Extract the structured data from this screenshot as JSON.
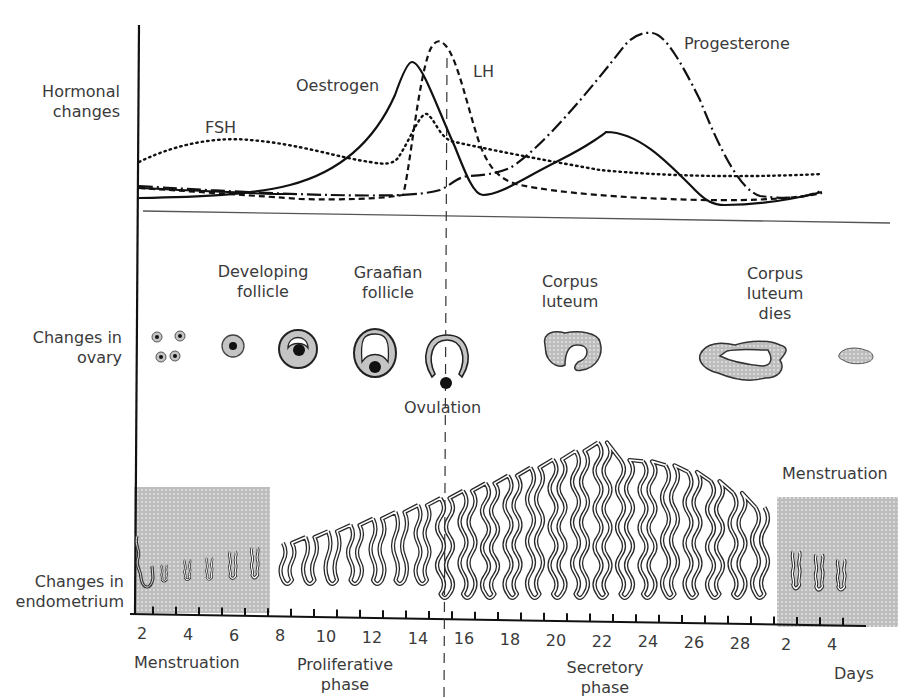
{
  "rows": {
    "hormones": "Hormonal changes",
    "ovary": "Changes in ovary",
    "endometrium": "Changes in endometrium"
  },
  "hormone_labels": {
    "fsh": "FSH",
    "oestrogen": "Oestrogen",
    "lh": "LH",
    "progesterone": "Progesterone"
  },
  "ovary_labels": {
    "developing": "Developing follicle",
    "graafian": "Graafian follicle",
    "ovulation": "Ovulation",
    "corpus_luteum": "Corpus luteum",
    "corpus_luteum_dies": "Corpus luteum dies"
  },
  "phase_labels": {
    "menstruation_start": "Menstruation",
    "proliferative": "Proliferative phase",
    "secretory": "Secretory phase",
    "menstruation_end": "Menstruation",
    "days": "Days"
  },
  "axis": {
    "day_ticks": [
      "2",
      "4",
      "6",
      "8",
      "10",
      "12",
      "14",
      "16",
      "18",
      "20",
      "22",
      "24",
      "26",
      "28",
      "2",
      "4"
    ],
    "ovulation_day": 14
  },
  "colors": {
    "line": "#1a1a1a",
    "menses_fill": "#bdbdbd",
    "follicle_fill": "#c8c8c8",
    "text": "#3a3a3a"
  },
  "chart_data": {
    "type": "line",
    "title": "",
    "xlabel": "Days",
    "ylabel": "Hormonal changes",
    "x": [
      1,
      2,
      3,
      4,
      5,
      6,
      7,
      8,
      9,
      10,
      11,
      12,
      13,
      14,
      15,
      16,
      17,
      18,
      19,
      20,
      21,
      22,
      23,
      24,
      25,
      26,
      27,
      28
    ],
    "series": [
      {
        "name": "FSH",
        "style": "dotted",
        "values": [
          3,
          3.6,
          3.9,
          4,
          3.9,
          3.7,
          3.3,
          3,
          2.6,
          2.4,
          2.3,
          2.3,
          5,
          3.2,
          2.6,
          2.3,
          2.1,
          1.9,
          1.8,
          1.7,
          1.6,
          1.5,
          1.5,
          1.4,
          1.4,
          1.3,
          1.3,
          1.4
        ]
      },
      {
        "name": "Oestrogen",
        "style": "solid",
        "values": [
          0.5,
          0.5,
          0.6,
          0.7,
          0.9,
          1.2,
          1.6,
          2.2,
          3,
          4,
          5.4,
          7,
          8.2,
          5.5,
          1,
          1.3,
          2.2,
          3.4,
          4.3,
          4.8,
          4.6,
          3.9,
          2.6,
          1,
          0.4,
          0.4,
          0.5,
          0.7
        ]
      },
      {
        "name": "LH",
        "style": "dashed",
        "values": [
          0.9,
          0.8,
          0.7,
          0.6,
          0.5,
          0.5,
          0.4,
          0.4,
          0.3,
          0.3,
          0.3,
          0.4,
          9,
          9.6,
          5,
          1.5,
          1,
          0.8,
          0.6,
          0.5,
          0.4,
          0.4,
          0.4,
          0.4,
          0.4,
          0.4,
          0.5,
          0.6
        ]
      },
      {
        "name": "Progesterone",
        "style": "dash-dot",
        "values": [
          0.8,
          0.7,
          0.7,
          0.6,
          0.6,
          0.6,
          0.5,
          0.5,
          0.5,
          0.5,
          0.5,
          0.6,
          0.8,
          1.5,
          1.7,
          2.1,
          3.1,
          5,
          7.2,
          9,
          10,
          9.5,
          6.5,
          2.8,
          0.6,
          0.5,
          0.5,
          0.7
        ]
      }
    ],
    "annotations": [
      "Ovulation at day 14 (dashed vertical line)"
    ],
    "grid": false
  }
}
